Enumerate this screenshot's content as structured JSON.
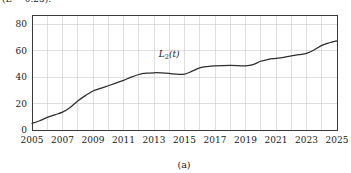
{
  "figure": {
    "top_clipped_text": "(L = 0.25).",
    "caption": "(a)"
  },
  "series_label": {
    "base": "L",
    "subscript": "2",
    "argument": "(t)"
  },
  "chart_data": {
    "type": "line",
    "title": "",
    "subtitle": "",
    "xlabel": "",
    "ylabel": "",
    "caption": "(a)",
    "grid": true,
    "legend": false,
    "legend_position": "inline-annotation",
    "xlim": [
      2005,
      2025
    ],
    "ylim": [
      0,
      87
    ],
    "xticks": [
      2005,
      2007,
      2009,
      2011,
      2013,
      2015,
      2017,
      2019,
      2021,
      2023,
      2025
    ],
    "xtick_labels": [
      "2005",
      "2007",
      "2009",
      "2011",
      "2013",
      "2015",
      "2017",
      "2019",
      "2021",
      "2023",
      "2025"
    ],
    "x_minor_gridlines": [
      2006,
      2008,
      2010,
      2012,
      2014,
      2016,
      2018,
      2020,
      2022,
      2024
    ],
    "yticks": [
      0,
      20,
      40,
      60,
      80
    ],
    "ytick_labels": [
      "0",
      "20",
      "40",
      "60",
      "80"
    ],
    "series": [
      {
        "name": "L2(t)",
        "color": "#2e2e2e",
        "annotation": "L₂(t)",
        "annotation_x": 2014.0,
        "annotation_y": 55,
        "x": [
          2005,
          2005.5,
          2006,
          2006.5,
          2007,
          2007.5,
          2008,
          2008.5,
          2009,
          2009.5,
          2010,
          2010.5,
          2011,
          2011.5,
          2012,
          2012.5,
          2013,
          2013.5,
          2014,
          2014.5,
          2015,
          2015.5,
          2016,
          2016.5,
          2017,
          2017.5,
          2018,
          2018.5,
          2019,
          2019.5,
          2020,
          2020.5,
          2021,
          2021.5,
          2022,
          2022.5,
          2023,
          2023.5,
          2024,
          2024.5,
          2025
        ],
        "values": [
          5,
          7,
          9.5,
          11.5,
          13.5,
          17,
          22,
          26,
          29.5,
          31.5,
          33.5,
          35.5,
          37.5,
          40,
          42,
          43,
          43.3,
          43.2,
          42.8,
          42.2,
          42.2,
          44.5,
          47,
          48,
          48.5,
          48.7,
          48.8,
          48.7,
          48.5,
          49.5,
          52,
          53.5,
          54.2,
          55,
          56,
          57,
          58,
          60.5,
          64,
          66,
          67.5
        ]
      }
    ]
  }
}
